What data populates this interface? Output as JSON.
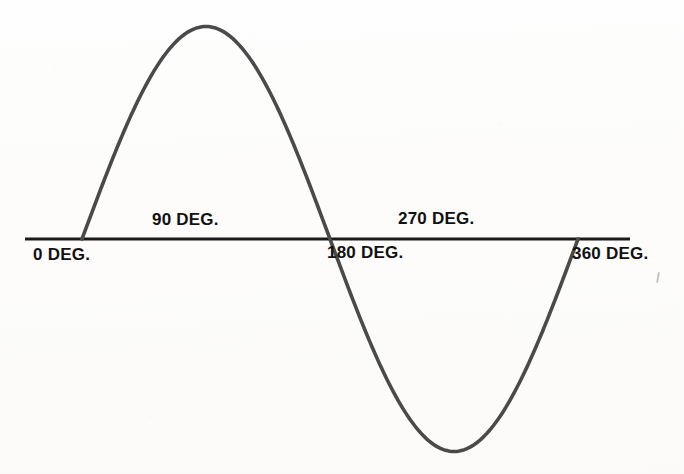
{
  "document": {
    "type": "technical-illustration",
    "title": "Sine wave over one full cycle (0 to 360 degrees)",
    "background_color": "#fdfcfb",
    "ink_color": "#4a4a4a",
    "text_color": "#111111"
  },
  "axis": {
    "name": "horizontal-baseline",
    "color": "#1a1a1a",
    "x_start_px": 25,
    "x_end_px": 630,
    "y_px": 239,
    "thickness_px": 3
  },
  "labels": [
    {
      "id": "label-0",
      "number": "0",
      "unit": "DEG.",
      "text": "0 DEG."
    },
    {
      "id": "label-90",
      "number": "90",
      "unit": "DEG.",
      "text": "90 DEG."
    },
    {
      "id": "label-180",
      "number": "180",
      "unit": "DEG.",
      "text": "180 DEG."
    },
    {
      "id": "label-270",
      "number": "270",
      "unit": "DEG.",
      "text": "270 DEG."
    },
    {
      "id": "label-360",
      "number": "360",
      "unit": "DEG.",
      "text": "360 DEG."
    }
  ],
  "chart_data": {
    "type": "line",
    "title": "",
    "subtitle": "",
    "xlabel": "",
    "ylabel": "",
    "grid": false,
    "legend": null,
    "series": [
      {
        "name": "sine",
        "formula": "y = sin(x)",
        "stroke_color": "#4a4a4a",
        "stroke_width_px": 3.6,
        "x": [
          0,
          15,
          30,
          45,
          60,
          75,
          90,
          105,
          120,
          135,
          150,
          165,
          180,
          195,
          210,
          225,
          240,
          255,
          270,
          285,
          300,
          315,
          330,
          345,
          360
        ],
        "values": [
          0,
          0.259,
          0.5,
          0.707,
          0.866,
          0.966,
          1,
          0.966,
          0.866,
          0.707,
          0.5,
          0.259,
          0,
          -0.259,
          -0.5,
          -0.707,
          -0.866,
          -0.966,
          -1,
          -0.966,
          -0.866,
          -0.707,
          -0.5,
          -0.259,
          0
        ]
      }
    ],
    "xlim": [
      0,
      360
    ],
    "ylim": [
      -1,
      1
    ],
    "xticks": [
      0,
      90,
      180,
      270,
      360
    ],
    "xticklabels": [
      "0 DEG.",
      "90 DEG.",
      "180 DEG.",
      "270 DEG.",
      "360 DEG."
    ],
    "yticks": [],
    "yticklabels": [],
    "annotations": [
      {
        "label": "zero crossing",
        "x": 0,
        "y": 0
      },
      {
        "label": "positive peak",
        "x": 90,
        "y": 1
      },
      {
        "label": "zero crossing",
        "x": 180,
        "y": 0
      },
      {
        "label": "negative peak",
        "x": 270,
        "y": -1
      },
      {
        "label": "zero crossing",
        "x": 360,
        "y": 0
      }
    ],
    "geometry_px": {
      "x0": 82,
      "x360": 578,
      "baseline_y": 239,
      "peak_y": 26,
      "trough_y": 451
    }
  }
}
